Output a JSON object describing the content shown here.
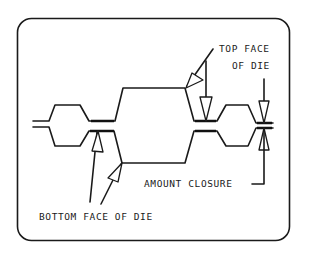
{
  "diagram": {
    "type": "technical-cross-section",
    "labels": {
      "top_face_line1": "TOP FACE",
      "top_face_line2": "OF DIE",
      "amount_closure": "AMOUNT CLOSURE",
      "bottom_face": "BOTTOM FACE OF DIE"
    },
    "colors": {
      "line": "#1a1a1a",
      "background": "#ffffff"
    }
  }
}
